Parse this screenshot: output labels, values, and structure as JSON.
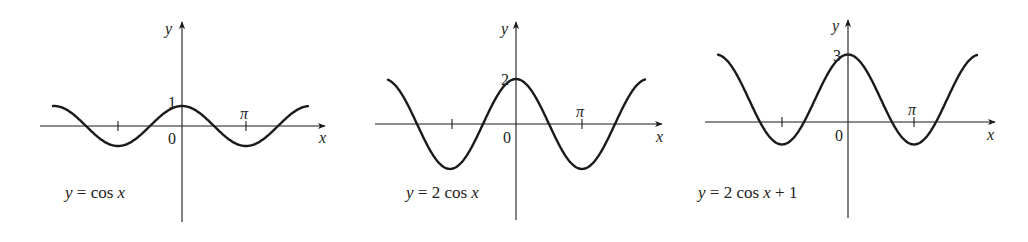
{
  "chart_data": [
    {
      "type": "line",
      "title": "y = cos x",
      "equation_label": "y = cos x",
      "xlabel": "x",
      "ylabel": "y",
      "origin_label": "0",
      "x_tick_labels": [
        "π"
      ],
      "y_tick_labels": [
        "1"
      ],
      "function": "cos(x)",
      "amplitude": 1,
      "vertical_shift": 0,
      "x_range": [
        -5.7,
        5.7
      ],
      "y_max_label": "1",
      "series": [
        {
          "name": "y = cos x",
          "x": [
            -5.7,
            -3.1416,
            0,
            3.1416,
            5.7
          ],
          "values": [
            0.83,
            -1,
            1,
            -1,
            0.83
          ]
        }
      ]
    },
    {
      "type": "line",
      "title": "y = 2 cos x",
      "equation_label": "y = 2 cos x",
      "xlabel": "x",
      "ylabel": "y",
      "origin_label": "0",
      "x_tick_labels": [
        "π"
      ],
      "y_tick_labels": [
        "2"
      ],
      "function": "2cos(x)",
      "amplitude": 2,
      "vertical_shift": 0,
      "x_range": [
        -5.7,
        5.7
      ],
      "y_max_label": "2",
      "series": [
        {
          "name": "y = 2 cos x",
          "x": [
            -5.7,
            -3.1416,
            0,
            3.1416,
            5.7
          ],
          "values": [
            1.67,
            -2,
            2,
            -2,
            1.67
          ]
        }
      ]
    },
    {
      "type": "line",
      "title": "y = 2 cos x + 1",
      "equation_label": "y = 2 cos x  +  1",
      "xlabel": "x",
      "ylabel": "y",
      "origin_label": "0",
      "x_tick_labels": [
        "π"
      ],
      "y_tick_labels": [
        "3"
      ],
      "function": "2cos(x)+1",
      "amplitude": 2,
      "vertical_shift": 1,
      "x_range": [
        -5.7,
        5.7
      ],
      "y_max_label": "3",
      "series": [
        {
          "name": "y = 2 cos x + 1",
          "x": [
            -5.7,
            -3.1416,
            0,
            3.1416,
            5.7
          ],
          "values": [
            2.67,
            -1,
            3,
            -1,
            2.67
          ]
        }
      ]
    }
  ],
  "panels": [
    {
      "ox": 182,
      "oy": 126,
      "pi_px": 64,
      "unit_px": 20,
      "amp": 1,
      "shift": 0,
      "x_start": 53,
      "x_end": 308,
      "axis_left": 40,
      "axis_right": 325,
      "yaxis_top": 22,
      "yaxis_bottom": 222,
      "eq_x": 65,
      "eq_y": 198
    },
    {
      "ox": 516,
      "oy": 124,
      "pi_px": 66,
      "unit_px": 22.5,
      "amp": 2,
      "shift": 0,
      "x_start": 388,
      "x_end": 645,
      "axis_left": 375,
      "axis_right": 662,
      "yaxis_top": 22,
      "yaxis_bottom": 220,
      "eq_x": 406,
      "eq_y": 198
    },
    {
      "ox": 848,
      "oy": 122,
      "pi_px": 66,
      "unit_px": 22.5,
      "amp": 2,
      "shift": 1,
      "x_start": 718,
      "x_end": 977,
      "axis_left": 705,
      "axis_right": 995,
      "yaxis_top": 20,
      "yaxis_bottom": 218,
      "eq_x": 698,
      "eq_y": 198
    }
  ]
}
